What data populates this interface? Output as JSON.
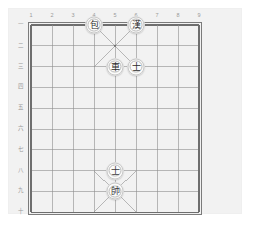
{
  "app": {
    "title": "Xiangqi Board",
    "board_background": "#f2f2f2",
    "page_background": "#ffffff",
    "line_color": "#8d8d8d",
    "border_color": "#6e6e6e",
    "label_color": "#9a9a9a",
    "piece_face": "#fbfbfa",
    "piece_text": "#2e2e2e"
  },
  "board": {
    "files": 9,
    "ranks": 10,
    "file_labels": [
      "1",
      "2",
      "3",
      "4",
      "5",
      "6",
      "7",
      "8",
      "9"
    ],
    "rank_labels": [
      "一",
      "二",
      "三",
      "四",
      "五",
      "六",
      "七",
      "八",
      "九",
      "十"
    ],
    "palaces": [
      {
        "name": "top-palace",
        "file_from": 4,
        "file_to": 6,
        "rank_from": 1,
        "rank_to": 3
      },
      {
        "name": "bottom-palace",
        "file_from": 4,
        "file_to": 6,
        "rank_from": 8,
        "rank_to": 10
      }
    ],
    "marks": [
      {
        "name": "center-dot",
        "file": 5,
        "rank": 2
      }
    ]
  },
  "pieces": [
    {
      "name": "piece-bao",
      "glyph": "包",
      "label": "Cannon",
      "side": "black",
      "file": 4,
      "rank": 1
    },
    {
      "name": "piece-han",
      "glyph": "漢",
      "label": "Han",
      "side": "black",
      "file": 6,
      "rank": 1
    },
    {
      "name": "piece-ju",
      "glyph": "車",
      "label": "Chariot",
      "side": "black",
      "file": 5,
      "rank": 3
    },
    {
      "name": "piece-shi-upper",
      "glyph": "士",
      "label": "Advisor",
      "side": "black",
      "file": 6,
      "rank": 3
    },
    {
      "name": "piece-shi-lower",
      "glyph": "士",
      "label": "Advisor",
      "side": "red",
      "file": 5,
      "rank": 8
    },
    {
      "name": "piece-shuai",
      "glyph": "帥",
      "label": "General",
      "side": "red",
      "file": 5,
      "rank": 9
    }
  ]
}
